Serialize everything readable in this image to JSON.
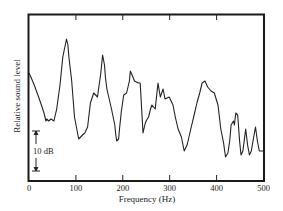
{
  "chart_data": {
    "type": "line",
    "title": "",
    "xlabel": "Frequency (Hz)",
    "ylabel": "Relative sound level",
    "xlim": [
      0,
      500
    ],
    "xticks": [
      0,
      100,
      200,
      300,
      400,
      500
    ],
    "xtick_labels": [
      "0",
      "100",
      "200",
      "300",
      "400",
      "500"
    ],
    "yticks": [],
    "y_units": "dB (relative, 0 = bottom of frame)",
    "ylim": [
      0,
      41.75
    ],
    "grid": false,
    "legend": null,
    "scale_bar": {
      "label": "10 dB",
      "value_db": 10
    },
    "series": [
      {
        "name": "Relative sound level",
        "x": [
          0,
          4,
          11,
          19,
          25,
          32,
          36,
          38,
          42,
          47,
          53,
          59,
          66,
          72,
          80,
          83,
          85,
          91,
          97,
          106,
          110,
          114,
          119,
          125,
          131,
          138,
          146,
          153,
          157,
          161,
          163,
          166,
          176,
          183,
          185,
          187,
          191,
          193,
          197,
          202,
          208,
          214,
          216,
          218,
          225,
          233,
          237,
          243,
          248,
          252,
          255,
          259,
          262,
          269,
          275,
          280,
          286,
          290,
          299,
          307,
          312,
          318,
          325,
          331,
          337,
          345,
          353,
          358,
          364,
          369,
          375,
          381,
          388,
          395,
          403,
          409,
          415,
          419,
          424,
          428,
          431,
          436,
          438,
          441,
          445,
          449,
          452,
          456,
          462,
          466,
          470,
          474,
          479,
          483,
          487,
          491,
          495,
          500
        ],
        "values": [
          27,
          26,
          24,
          21.5,
          19.5,
          17,
          15,
          15.5,
          15,
          15.5,
          15,
          18,
          24,
          31,
          35.5,
          34,
          31,
          25,
          16,
          10.5,
          11,
          11.5,
          12,
          13.5,
          19.5,
          22,
          21,
          27,
          31.5,
          29,
          26,
          23,
          18,
          14,
          11.5,
          10,
          10.5,
          13,
          17.5,
          21.5,
          22,
          25,
          27.5,
          27,
          25,
          24.5,
          24.5,
          12,
          14.5,
          15.5,
          16,
          18,
          19,
          18,
          24.5,
          21,
          23,
          20.5,
          21,
          19,
          16,
          13,
          11,
          7.5,
          9,
          13,
          17,
          19.5,
          22,
          24.5,
          25,
          23.5,
          22.5,
          22,
          19,
          13,
          9.5,
          6,
          7,
          10,
          14,
          15,
          14,
          17,
          16.5,
          10,
          6.5,
          7.5,
          13,
          9,
          6.5,
          7.5,
          11,
          13.5,
          10,
          7.5,
          7.5,
          7.5
        ]
      }
    ]
  },
  "labels": {
    "xlabel": "Frequency (Hz)",
    "ylabel": "Relative sound level",
    "scale_bar": "10 dB",
    "xticks": [
      "0",
      "100",
      "200",
      "300",
      "400",
      "500"
    ]
  }
}
